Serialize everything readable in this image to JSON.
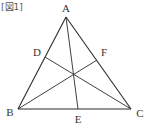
{
  "caption": "[図1]",
  "vertices": {
    "A": {
      "label": "A",
      "x": 66,
      "y": 17,
      "lx": 66,
      "ly": 12
    },
    "B": {
      "label": "B",
      "x": 18,
      "y": 109,
      "lx": 10,
      "ly": 116
    },
    "C": {
      "label": "C",
      "x": 131,
      "y": 109,
      "lx": 140,
      "ly": 117
    },
    "D": {
      "label": "D",
      "x": 45,
      "y": 57,
      "lx": 37,
      "ly": 56
    },
    "E": {
      "label": "E",
      "x": 78,
      "y": 109,
      "lx": 78,
      "ly": 123
    },
    "F": {
      "label": "F",
      "x": 97,
      "y": 60,
      "lx": 104,
      "ly": 56
    }
  },
  "segments": [
    {
      "name": "side-AB",
      "from": "A",
      "to": "B"
    },
    {
      "name": "side-BC",
      "from": "B",
      "to": "C"
    },
    {
      "name": "side-CA",
      "from": "C",
      "to": "A"
    },
    {
      "name": "cevian-AE",
      "from": "A",
      "to": "E"
    },
    {
      "name": "cevian-CD",
      "from": "C",
      "to": "D"
    },
    {
      "name": "cevian-BF",
      "from": "B",
      "to": "F"
    }
  ],
  "colors": {
    "line": "#2a2a2a",
    "text": "#333333",
    "background": "#ffffff"
  }
}
